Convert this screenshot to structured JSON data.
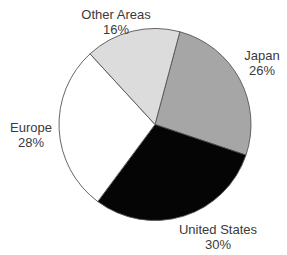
{
  "chart_data": {
    "type": "pie",
    "title": "",
    "categories": [
      "Japan",
      "United States",
      "Europe",
      "Other Areas"
    ],
    "values": [
      26,
      30,
      28,
      16
    ],
    "unit": "%",
    "slices": [
      {
        "label": "Japan",
        "value": 26,
        "value_label": "26%",
        "color": "#a6a6a6"
      },
      {
        "label": "United States",
        "value": 30,
        "value_label": "30%",
        "color": "#050505"
      },
      {
        "label": "Europe",
        "value": 28,
        "value_label": "28%",
        "color": "#ffffff"
      },
      {
        "label": "Other Areas",
        "value": 16,
        "value_label": "16%",
        "color": "#dcdcdc"
      }
    ],
    "start_angle_deg": 15,
    "direction": "clockwise",
    "legend": "none (direct labels)",
    "outline_color": "#555555"
  },
  "labels": {
    "japan": {
      "name": "Japan",
      "pct": "26%"
    },
    "united_states": {
      "name": "United States",
      "pct": "30%"
    },
    "europe": {
      "name": "Europe",
      "pct": "28%"
    },
    "other": {
      "name": "Other Areas",
      "pct": "16%"
    }
  }
}
